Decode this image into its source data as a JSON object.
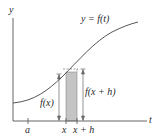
{
  "figure": {
    "axes": {
      "y_label": "y",
      "x_label": "t"
    },
    "curve_label": "y = f(t)",
    "tick_labels": {
      "a": "a",
      "x": "x",
      "x_plus_h": "x + h"
    },
    "height_labels": {
      "fx": "f(x)",
      "fxh": "f(x + h)"
    },
    "colors": {
      "axis": "#555555",
      "curve": "#555555",
      "shade": "#c4c4c4",
      "text": "#2a2a2a"
    }
  }
}
